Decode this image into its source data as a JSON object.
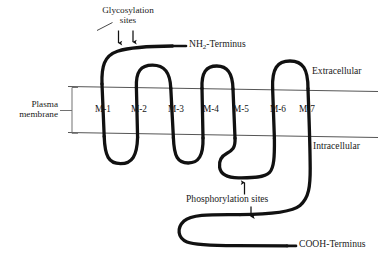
{
  "figure": {
    "kind": "membrane-protein-topology-diagram",
    "stroke_color": "#111111",
    "membrane_line_color": "#555555",
    "background_color": "#ffffff"
  },
  "labels": {
    "glycosylation": {
      "line1": "Glycosylation",
      "line2": "sites"
    },
    "n_terminus_pre": "NH",
    "n_terminus_sub": "2",
    "n_terminus_post": "-Terminus",
    "c_terminus": "COOH-Terminus",
    "extracellular": "Extracellular",
    "intracellular": "Intracellular",
    "plasma_membrane": {
      "line1": "Plasma",
      "line2": "membrane"
    },
    "phosphorylation": "Phosphorylation sites"
  },
  "helices": [
    {
      "id": "M-1",
      "label": "M-1",
      "x": 103
    },
    {
      "id": "M-2",
      "label": "M-2",
      "x": 139
    },
    {
      "id": "M-3",
      "label": "M-3",
      "x": 176
    },
    {
      "id": "M-4",
      "label": "M-4",
      "x": 211
    },
    {
      "id": "M-5",
      "label": "M-5",
      "x": 241
    },
    {
      "id": "M-6",
      "label": "M-6",
      "x": 278
    },
    {
      "id": "M-7",
      "label": "M-7",
      "x": 307
    }
  ],
  "markers": {
    "glycosylation_arrows": 2,
    "phosphorylation_arrows": 2
  }
}
